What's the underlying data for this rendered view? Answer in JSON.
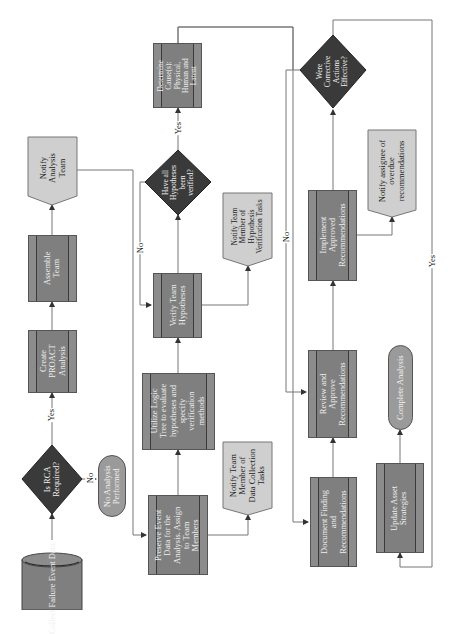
{
  "diagram": {
    "orientation": "rotated-90-ccw",
    "colors": {
      "process": "#7f7f7f",
      "decision": "#3a3a3a",
      "document": "#cfcfcf",
      "terminator": "#9a9a9a",
      "connector": "#666666"
    },
    "nodes": {
      "collect": "Collect Failure Event Data",
      "is_rca": [
        "Is RCA",
        "Required?"
      ],
      "no_analysis": [
        "No Analysis",
        "Performed"
      ],
      "create_proact": [
        "Create",
        "PROACT",
        "Analysis"
      ],
      "assemble": [
        "Assemble",
        "Team"
      ],
      "notify_analysis": [
        "Notify",
        "Analysis",
        "Team"
      ],
      "preserve": [
        "Preserve Event",
        "Data for the",
        "Analysis. Assign",
        "to Team",
        "Members"
      ],
      "notify_data": [
        "Notify Team",
        "Member of",
        "Data Collection",
        "Tasks"
      ],
      "logic_tree": [
        "Utilize Logic",
        "Tree to evaluate",
        "hypotheses and",
        "specify",
        "verification",
        "methods"
      ],
      "verify": [
        "Verify Team",
        "Hypotheses"
      ],
      "notify_hyp": [
        "Notify Team",
        "Member of",
        "Hypothesis",
        "Verification Tasks"
      ],
      "have_all": [
        "Have all",
        "Hypotheses",
        "been",
        "verified?"
      ],
      "determine": [
        "Determine",
        "Cause(s):",
        "Physical,",
        "Human and",
        "Latent"
      ],
      "document": [
        "Document Finding",
        "and",
        "Recommendations"
      ],
      "review": [
        "Review and",
        "Approve",
        "Recommendations"
      ],
      "implement": [
        "Implement",
        "Approved",
        "Recommendations"
      ],
      "notify_overdue": [
        "Notify assignee of",
        "overdue",
        "recommendations"
      ],
      "were_effective": [
        "Were",
        "Corrective",
        "Actions",
        "Effective?"
      ],
      "update": [
        "Update Asset",
        "Strategies"
      ],
      "complete": "Complete Analysis"
    },
    "edge_labels": {
      "rca_yes": "Yes",
      "rca_no": "No",
      "hyp_yes": "Yes",
      "hyp_no": "No",
      "eff_no": "No",
      "eff_yes": "Yes"
    }
  }
}
